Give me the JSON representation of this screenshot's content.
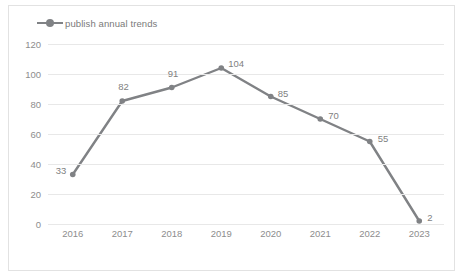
{
  "chart_data": {
    "type": "line",
    "title": "",
    "xlabel": "",
    "ylabel": "",
    "categories": [
      "2016",
      "2017",
      "2018",
      "2019",
      "2020",
      "2021",
      "2022",
      "2023"
    ],
    "series": [
      {
        "name": "publish annual trends",
        "values": [
          33,
          82,
          91,
          104,
          85,
          70,
          55,
          2
        ],
        "color": "#808285",
        "marker": "circle",
        "data_labels": [
          "33",
          "82",
          "91",
          "104",
          "85",
          "70",
          "55",
          "2"
        ]
      }
    ],
    "ylim": [
      0,
      120
    ],
    "y_ticks": [
      "0",
      "20",
      "40",
      "60",
      "80",
      "100",
      "120"
    ],
    "y_tick_values": [
      0,
      20,
      40,
      60,
      80,
      100,
      120
    ],
    "grid": "horizontal",
    "legend": {
      "position": "top-left",
      "entries": [
        "publish annual trends"
      ],
      "marker_icon": "line-with-dot-marker"
    },
    "border": true,
    "colors": {
      "line": "#808285",
      "grid": "#e8e8e8",
      "text": "#8d8d8d",
      "border": "#e2e2e2",
      "background": "#ffffff"
    }
  }
}
